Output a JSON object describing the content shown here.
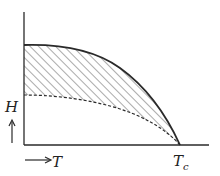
{
  "diagram": {
    "type": "phase-diagram",
    "axes": {
      "y_label": "H",
      "x_label": "T",
      "x_marker_main": "T",
      "x_marker_sub": "c"
    },
    "curves": [
      {
        "name": "upper-critical-field",
        "style": "solid"
      },
      {
        "name": "lower-critical-field",
        "style": "dashed"
      }
    ],
    "shaded_region": "hatched area between curves",
    "colors": {
      "line": "#2a2a2a",
      "hatch": "#444444",
      "background": "#ffffff"
    }
  }
}
